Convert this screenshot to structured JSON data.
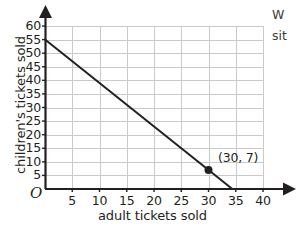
{
  "chart_data": {
    "type": "line",
    "title": "",
    "xlabel": "adult tickets sold",
    "ylabel": "children's tickets sold",
    "xlim": [
      0,
      40
    ],
    "ylim": [
      0,
      60
    ],
    "xticks": [
      5,
      10,
      15,
      20,
      25,
      30,
      35,
      40
    ],
    "yticks": [
      5,
      10,
      15,
      20,
      25,
      30,
      35,
      40,
      45,
      50,
      55,
      60
    ],
    "xtick_labels": [
      "5",
      "10",
      "15",
      "20",
      "25",
      "30",
      "35",
      "40"
    ],
    "ytick_labels": [
      "5",
      "10",
      "15",
      "20",
      "25",
      "30",
      "35",
      "40",
      "45",
      "50",
      "55",
      "60"
    ],
    "grid": true,
    "legend": false,
    "origin_label": "O",
    "series": [
      {
        "name": "ticket sales line",
        "x": [
          0,
          34.375
        ],
        "y": [
          55,
          0
        ],
        "color": "#231f20",
        "line_width": 2
      }
    ],
    "points": [
      {
        "x": 30,
        "y": 7,
        "label": "(30, 7)",
        "marker": "filled-circle",
        "color": "#231f20"
      }
    ],
    "axis_color": "#231f20",
    "grid_color": "#c9c9c9",
    "background": "#ffffff"
  },
  "side_text": {
    "line1": "W",
    "line2": "sit"
  }
}
